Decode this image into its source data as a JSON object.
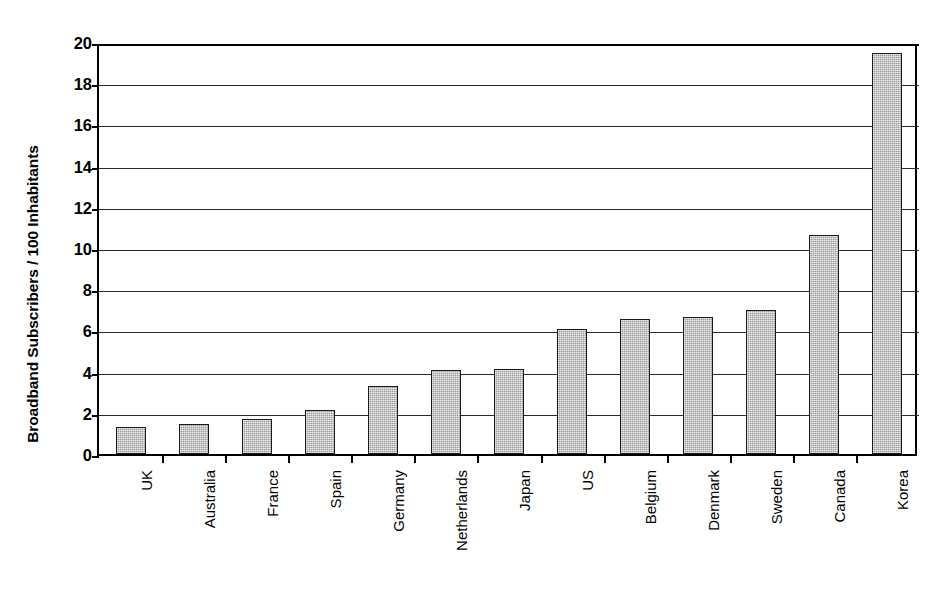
{
  "chart_data": {
    "type": "bar",
    "title": "",
    "subtitle": "",
    "xlabel": "",
    "ylabel": "Broadband Subscribers / 100 Inhabitants",
    "categories": [
      "UK",
      "Australia",
      "France",
      "Spain",
      "Germany",
      "Netherlands",
      "Japan",
      "US",
      "Belgium",
      "Denmark",
      "Sweden",
      "Canada",
      "Korea"
    ],
    "values": [
      1.3,
      1.45,
      1.7,
      2.15,
      3.3,
      4.1,
      4.15,
      6.05,
      6.55,
      6.65,
      7.0,
      10.65,
      19.45
    ],
    "ylim": [
      0,
      20
    ],
    "ytick_values": [
      0,
      2,
      4,
      6,
      8,
      10,
      12,
      14,
      16,
      18,
      20
    ],
    "ytick_labels": [
      "0",
      "2",
      "4",
      "6",
      "8",
      "10",
      "12",
      "14",
      "16",
      "18",
      "20"
    ],
    "grid": true,
    "grid_axis": "y",
    "legend": false,
    "legend_position": "none",
    "bar_color": "#9a9a9a",
    "bar_edge_color": "#1a1a1a",
    "axis_color": "#000000",
    "grid_color": "#2a2a2a",
    "background_color": "#ffffff",
    "annotations": []
  }
}
